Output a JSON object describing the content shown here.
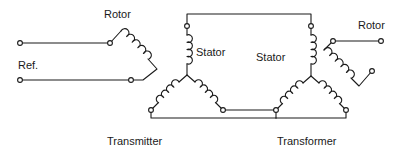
{
  "diagram": {
    "stroke_color": "#1a1a1a",
    "background_color": "#ffffff",
    "terminal_fill": "#ffffff",
    "labels": {
      "rotor_left": "Rotor",
      "rotor_right": "Rotor",
      "reference": "Ref.",
      "stator_left": "Stator",
      "stator_right": "Stator",
      "transmitter": "Transmitter",
      "transformer": "Transformer"
    },
    "units": [
      {
        "name": "Transmitter",
        "rotor": {
          "terminals": 2,
          "winding": "diagonal-coil",
          "label": "Rotor"
        },
        "stator": {
          "configuration": "wye",
          "legs": 3,
          "label": "Stator"
        },
        "input": {
          "label": "Ref.",
          "terminals": 2
        }
      },
      {
        "name": "Transformer",
        "rotor": {
          "terminals": 2,
          "winding": "diagonal-coil",
          "label": "Rotor"
        },
        "stator": {
          "configuration": "wye",
          "legs": 3,
          "label": "Stator"
        },
        "output": {
          "terminals": 2
        }
      }
    ],
    "interconnects": [
      {
        "from": "transmitter-stator-top",
        "to": "transformer-stator-top",
        "path": "top"
      },
      {
        "from": "transmitter-stator-lower-right",
        "to": "transformer-stator-lower-left",
        "path": "bottom-upper"
      },
      {
        "from": "transmitter-stator-lower-left",
        "to": "transformer-stator-lower-right",
        "path": "bottom-lower"
      }
    ]
  }
}
